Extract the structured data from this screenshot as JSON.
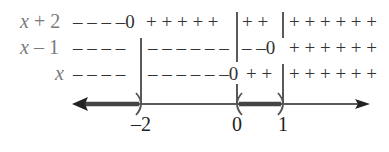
{
  "diagram": {
    "rows": [
      {
        "label_var": "x",
        "label_rest": " + 2",
        "signs": [
          {
            "text": "– – – –0",
            "x": 73
          },
          {
            "text": "+ + + + +",
            "x": 146
          },
          {
            "text": "+ +",
            "x": 241
          },
          {
            "text": "+ + + + + +",
            "x": 288
          }
        ]
      },
      {
        "label_var": "x",
        "label_rest": " – 1",
        "signs": [
          {
            "text": "– – – –",
            "x": 73
          },
          {
            "text": "– – – – – –",
            "x": 148
          },
          {
            "text": "– –0",
            "x": 241
          },
          {
            "text": "+ + + + + +",
            "x": 288
          }
        ]
      },
      {
        "label_var": "x",
        "label_rest": "",
        "signs": [
          {
            "text": "– – – –",
            "x": 73
          },
          {
            "text": "– – – – – –0",
            "x": 148
          },
          {
            "text": "+ +",
            "x": 246
          },
          {
            "text": "+ + + + + +",
            "x": 288
          }
        ]
      }
    ],
    "number_line": {
      "ticks": [
        {
          "label": "–2",
          "x": 141
        },
        {
          "label": "0",
          "x": 237
        },
        {
          "label": "1",
          "x": 283
        }
      ],
      "solution_intervals": [
        "(-∞, -2)",
        "(0, 1)"
      ],
      "endpoint_style": "open-parenthesis"
    },
    "colors": {
      "labels": "#7a7a7a",
      "signs": "#333333",
      "lines": "#222222",
      "shading": "#555555"
    }
  }
}
